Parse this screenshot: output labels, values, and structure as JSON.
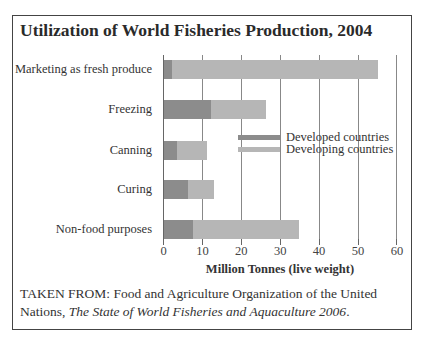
{
  "title": "Utilization of World Fisheries Production, 2004",
  "colors": {
    "developed": "#8c8c8c",
    "developing": "#b6b6b6",
    "gridline": "#888888",
    "frame": "#444444"
  },
  "legend": {
    "developed": "Developed countries",
    "developing": "Developing countries"
  },
  "source": {
    "prefix": "TAKEN FROM: Food and Agriculture Organization of the United Nations,",
    "italic": "The State of World Fisheries and Aquaculture 2006",
    "suffix": "."
  },
  "chart_data": {
    "type": "bar",
    "orientation": "horizontal",
    "stacked": true,
    "title": "Utilization of World Fisheries Production, 2004",
    "xlabel": "Million Tonnes (live weight)",
    "ylabel": "",
    "xlim": [
      0,
      60
    ],
    "xticks": [
      0,
      10,
      20,
      30,
      40,
      50,
      60
    ],
    "grid": true,
    "legend_position": "inside-right",
    "categories": [
      "Marketing as fresh produce",
      "Freezing",
      "Canning",
      "Curing",
      "Non-food purposes"
    ],
    "series": [
      {
        "name": "Developed countries",
        "values": [
          2.3,
          12.3,
          3.6,
          6.4,
          7.7
        ]
      },
      {
        "name": "Developing countries",
        "values": [
          53.1,
          14.1,
          7.7,
          6.7,
          27.2
        ]
      }
    ],
    "totals": [
      55.4,
      26.4,
      11.3,
      13.1,
      34.9
    ]
  }
}
